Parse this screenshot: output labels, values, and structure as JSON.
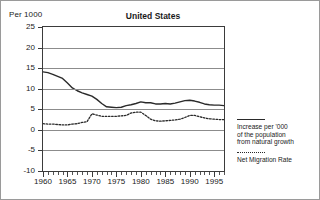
{
  "chart_data": {
    "type": "line",
    "title": "United States",
    "ylabel": "Per 1000",
    "xlabel": "",
    "ylim": [
      -10,
      25
    ],
    "xlim": [
      1960,
      1997
    ],
    "yticks": [
      25,
      20,
      15,
      10,
      5,
      0,
      -5,
      -10
    ],
    "xticks": [
      1960,
      1965,
      1970,
      1975,
      1980,
      1985,
      1990,
      1995
    ],
    "grid": true,
    "legend_position": "right",
    "x": [
      1960,
      1961,
      1962,
      1963,
      1964,
      1965,
      1966,
      1967,
      1968,
      1969,
      1970,
      1971,
      1972,
      1973,
      1974,
      1975,
      1976,
      1977,
      1978,
      1979,
      1980,
      1981,
      1982,
      1983,
      1984,
      1985,
      1986,
      1987,
      1988,
      1989,
      1990,
      1991,
      1992,
      1993,
      1994,
      1995,
      1996,
      1997
    ],
    "series": [
      {
        "name": "Increase per '000 of the population from natural growth",
        "style": "solid",
        "color": "#2a2a2a",
        "values": [
          14.1,
          13.9,
          13.5,
          13.0,
          12.5,
          11.4,
          10.2,
          9.5,
          9.0,
          8.6,
          8.2,
          7.4,
          6.4,
          5.6,
          5.5,
          5.4,
          5.5,
          5.9,
          6.1,
          6.4,
          6.8,
          6.6,
          6.6,
          6.3,
          6.3,
          6.4,
          6.3,
          6.5,
          6.8,
          7.1,
          7.2,
          7.0,
          6.7,
          6.3,
          6.1,
          6.0,
          6.0,
          5.9
        ]
      },
      {
        "name": "Net Migration Rate",
        "style": "dotted",
        "color": "#2a2a2a",
        "values": [
          1.5,
          1.4,
          1.4,
          1.3,
          1.2,
          1.2,
          1.4,
          1.5,
          1.8,
          2.0,
          3.9,
          3.6,
          3.3,
          3.3,
          3.3,
          3.3,
          3.4,
          3.5,
          4.1,
          4.3,
          4.3,
          3.5,
          2.6,
          2.2,
          2.1,
          2.2,
          2.3,
          2.4,
          2.6,
          3.0,
          3.5,
          3.5,
          3.2,
          2.9,
          2.7,
          2.6,
          2.5,
          2.5
        ]
      }
    ],
    "legend": [
      {
        "label": "Increase per '000\nof the population\nfrom natural growth",
        "style": "solid"
      },
      {
        "label": "Net Migration Rate",
        "style": "dotted"
      }
    ]
  },
  "axis": {
    "ytick_labels": [
      "25",
      "20",
      "15",
      "10",
      "5",
      "0",
      "-5",
      "-10"
    ],
    "xtick_labels": [
      "1960",
      "1965",
      "1970",
      "1975",
      "1980",
      "1985",
      "1990",
      "1995"
    ]
  }
}
